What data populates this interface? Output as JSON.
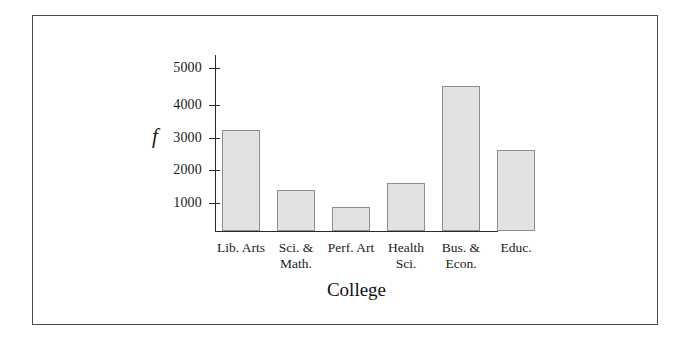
{
  "chart_data": {
    "type": "bar",
    "title": "",
    "subtitle": "",
    "xlabel": "College",
    "ylabel": "f",
    "categories": [
      "Lib. Arts",
      "Sci. & Math.",
      "Perf. Art",
      "Health Sci.",
      "Bus. & Econ.",
      "Educ."
    ],
    "category_lines": [
      [
        "Lib. Arts"
      ],
      [
        "Sci. &",
        "Math."
      ],
      [
        "Perf. Art"
      ],
      [
        "Health",
        "Sci."
      ],
      [
        "Bus. &",
        "Econ."
      ],
      [
        "Educ."
      ]
    ],
    "values": [
      3100,
      1250,
      750,
      1480,
      4450,
      2480
    ],
    "ylim": [
      0,
      5400
    ],
    "yticks": [
      1000,
      2000,
      3000,
      4000,
      5000
    ],
    "ytick_labels": [
      "1000",
      "2000",
      "3000",
      "4000",
      "5000"
    ],
    "grid": false,
    "legend": false,
    "legend_position": "none",
    "bar_fill_color": "#e2e2e2",
    "bar_edge_color": "#8e8e8e",
    "axis_color": "#2b2b2b",
    "frame_color": "#4a4a4a",
    "background_color": "#ffffff"
  }
}
